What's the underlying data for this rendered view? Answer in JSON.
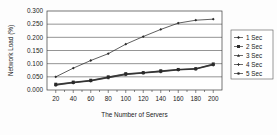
{
  "chart_data": {
    "type": "line",
    "title": "",
    "xlabel": "The Number of Servers",
    "ylabel": "Network Load (%)",
    "x": [
      20,
      40,
      60,
      80,
      100,
      120,
      140,
      160,
      180,
      200
    ],
    "xticklabels": [
      "20",
      "40",
      "60",
      "80",
      "100",
      "120",
      "140",
      "160",
      "180",
      "200"
    ],
    "yticklabels": [
      "0.000",
      "0.050",
      "0.100",
      "0.150",
      "0.200",
      "0.250",
      "0.300"
    ],
    "yticks": [
      0.0,
      0.05,
      0.1,
      0.15,
      0.2,
      0.25,
      0.3
    ],
    "xlim": [
      10,
      210
    ],
    "ylim": [
      0.0,
      0.3
    ],
    "grid": "horizontal",
    "legend_position": "right",
    "series": [
      {
        "name": "1 Sec",
        "marker": "diamond",
        "values": [
          0.05,
          0.083,
          0.112,
          0.138,
          0.174,
          0.203,
          0.23,
          0.254,
          0.265,
          0.269
        ]
      },
      {
        "name": "2 Sec",
        "marker": "square",
        "values": [
          0.022,
          0.03,
          0.037,
          0.05,
          0.062,
          0.066,
          0.073,
          0.078,
          0.081,
          0.099
        ]
      },
      {
        "name": "3 Sec",
        "marker": "triangle",
        "values": [
          0.021,
          0.029,
          0.036,
          0.049,
          0.061,
          0.066,
          0.072,
          0.078,
          0.081,
          0.098
        ]
      },
      {
        "name": "4 Sec",
        "marker": "cross",
        "values": [
          0.019,
          0.028,
          0.035,
          0.047,
          0.059,
          0.065,
          0.07,
          0.077,
          0.08,
          0.096
        ]
      },
      {
        "name": "5 Sec",
        "marker": "star",
        "values": [
          0.018,
          0.027,
          0.034,
          0.046,
          0.058,
          0.064,
          0.069,
          0.076,
          0.079,
          0.095
        ]
      }
    ]
  },
  "colors": {
    "axis": "#3a3a3a",
    "grid": "#4d4d4d",
    "series": "#2b2b2b",
    "background": "#fdfdfd"
  }
}
